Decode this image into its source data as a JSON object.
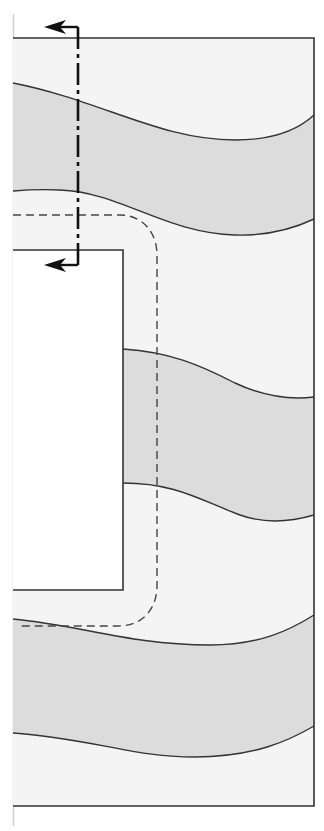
{
  "diagram": {
    "colors": {
      "background": "#ffffff",
      "light_fill": "#f4f4f4",
      "band_fill": "#dcdcdc",
      "outline": "#333333",
      "edge_line": "#c8c8c8",
      "section_line": "#111111",
      "path_dashed": "#444444"
    },
    "elements": [
      {
        "name": "outer-body",
        "label": "Layered body outline"
      },
      {
        "name": "cutout-notch",
        "label": "Rectangular cutout"
      },
      {
        "name": "layer-band-1",
        "label": "Upper shaded layer"
      },
      {
        "name": "layer-band-2",
        "label": "Middle shaded layer"
      },
      {
        "name": "layer-band-3",
        "label": "Lower shaded layer"
      },
      {
        "name": "section-line",
        "label": "Cutting-plane line with view arrows"
      },
      {
        "name": "dashed-path",
        "label": "Hidden/offset path around cutout"
      }
    ]
  }
}
